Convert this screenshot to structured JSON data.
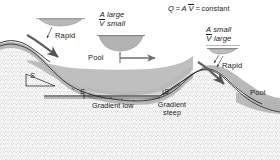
{
  "figure": {
    "equation": {
      "q_symbol": "Q",
      "eq1": "=",
      "a_symbol": "A",
      "v_symbol": "V",
      "eq2": "=",
      "constant_word": "constant",
      "full_text": "Q = A V̅ = constant"
    },
    "labels": {
      "rapid_left": "Rapid",
      "rapid_right": "Rapid",
      "pool_left": "Pool",
      "pool_right": "Pool",
      "gradient_low": "Gradient low",
      "gradient_steep": "Gradient steep",
      "gradient_low_line1": "Gradient",
      "gradient_low_line2": "low",
      "gradient_steep_line1": "Gradient",
      "gradient_steep_line2": "steep",
      "slope_marker_left": "S",
      "slope_marker_mid": "S",
      "slope_marker_right": "S"
    },
    "callout_pool": {
      "line1_a": "A",
      "line1_b": "large",
      "line2_a": "V",
      "line2_b": "small",
      "line1": "A large",
      "line2": "V̅ small"
    },
    "callout_rapid": {
      "line1_a": "A",
      "line1_b": "small",
      "line2_a": "V",
      "line2_b": "large",
      "line1": "A small",
      "line2": "V̅ large"
    },
    "colors": {
      "water": "#b4b4b4",
      "bed_stipple": "#9a9a9a",
      "ink": "#1a1a1a",
      "background": "#ffffff",
      "arrow": "#6e6e6e",
      "cross_section": "#b0b0b0"
    }
  }
}
